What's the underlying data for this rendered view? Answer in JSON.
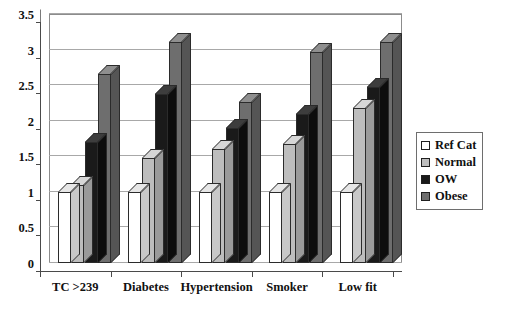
{
  "chart_data": {
    "type": "bar",
    "title": "",
    "subtitle": "",
    "xlabel": "",
    "ylabel": "",
    "categories": [
      "TC >239",
      "Diabetes",
      "Hypertension",
      "Smoker",
      "Low fit"
    ],
    "series": [
      {
        "name": "Ref Cat",
        "color": "#ffffff",
        "values": [
          1.0,
          1.0,
          1.0,
          1.0,
          1.0
        ]
      },
      {
        "name": "Normal",
        "color": "#bdbdbd",
        "values": [
          1.1,
          1.48,
          1.6,
          1.67,
          2.18
        ]
      },
      {
        "name": "OW",
        "color": "#1a1a1a",
        "values": [
          1.7,
          2.38,
          1.9,
          2.1,
          2.48
        ]
      },
      {
        "name": "Obese",
        "color": "#6e6e6e",
        "values": [
          2.65,
          3.1,
          2.27,
          2.97,
          3.1
        ]
      }
    ],
    "ylim": [
      0,
      3.5
    ],
    "ytick_step": 0.5,
    "yticks": [
      "0",
      "0.5",
      "1",
      "1.5",
      "2",
      "2.5",
      "3",
      "3.5"
    ],
    "grid": true,
    "grid_axis": "y",
    "legend_position": "right",
    "three_d": true
  },
  "legend": {
    "items": [
      {
        "label": "Ref Cat",
        "swatch": "lg-ref"
      },
      {
        "label": "Normal",
        "swatch": "lg-normal"
      },
      {
        "label": "OW",
        "swatch": "lg-ow"
      },
      {
        "label": "Obese",
        "swatch": "lg-obese"
      }
    ]
  },
  "caption": {
    "text": ""
  }
}
